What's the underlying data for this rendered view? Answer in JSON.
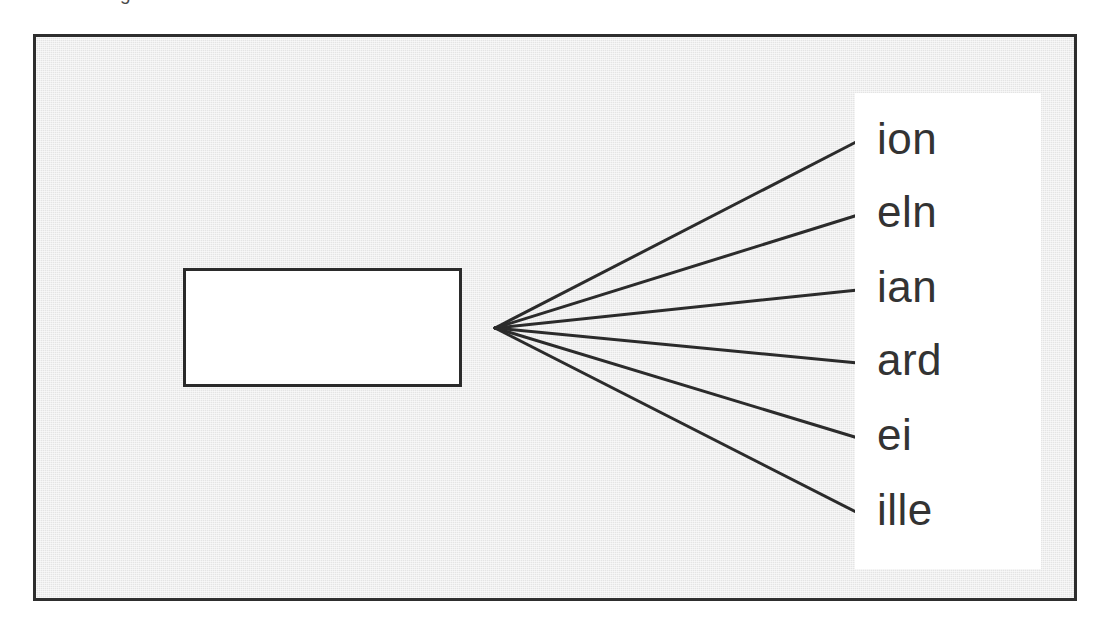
{
  "figure": {
    "caption_remnant": "g",
    "background_color": "#e4e4e4",
    "border_color": "#2e2e2e",
    "source_node": {
      "label": "",
      "fill_color": "#ffffff",
      "border_color": "#2b2b2b"
    },
    "vertex": {
      "x": 492,
      "y": 325
    },
    "connectors": [
      {
        "id": "connector-1",
        "x1": 459,
        "y1": 291,
        "x2": 822,
        "y2": 104
      },
      {
        "id": "connector-2",
        "x1": 459,
        "y1": 291,
        "x2": 822,
        "y2": 178
      },
      {
        "id": "connector-3",
        "x1": 459,
        "y1": 291,
        "x2": 822,
        "y2": 253
      },
      {
        "id": "connector-4",
        "x1": 459,
        "y1": 291,
        "x2": 822,
        "y2": 326
      },
      {
        "id": "connector-5",
        "x1": 459,
        "y1": 291,
        "x2": 822,
        "y2": 401
      },
      {
        "id": "connector-6",
        "x1": 459,
        "y1": 291,
        "x2": 822,
        "y2": 476
      }
    ],
    "line_color": "#2b2b2b",
    "label_panel": {
      "background_color": "#ffffff",
      "items": [
        {
          "text": "ion",
          "top": 24
        },
        {
          "text": "eln",
          "top": 97
        },
        {
          "text": "ian",
          "top": 172
        },
        {
          "text": "ard",
          "top": 245
        },
        {
          "text": "ei",
          "top": 320
        },
        {
          "text": "ille",
          "top": 395
        }
      ]
    }
  }
}
